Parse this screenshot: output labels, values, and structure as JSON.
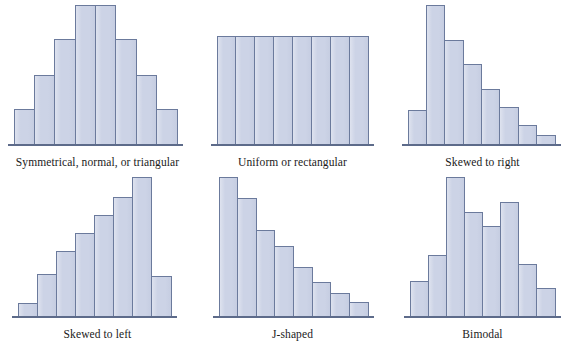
{
  "figure": {
    "title": "",
    "panel_count": 6,
    "bar_fill_color": "#ccd3e6",
    "bar_border_color": "#6b7a9c",
    "axis_color": "#5d6b8a",
    "background_color": "#ffffff",
    "label_color": "#1a1a1a"
  },
  "chart_data": [
    {
      "type": "bar",
      "title": "Symmetrical, normal, or triangular",
      "xlabel": "",
      "ylabel": "",
      "grid": false,
      "legend": false,
      "axis_range": [
        0,
        100
      ],
      "categories": [
        "1",
        "2",
        "3",
        "4",
        "5",
        "6",
        "7",
        "8"
      ],
      "values": [
        26,
        50,
        76,
        100,
        100,
        76,
        50,
        26
      ]
    },
    {
      "type": "bar",
      "title": "Uniform or rectangular",
      "xlabel": "",
      "ylabel": "",
      "grid": false,
      "legend": false,
      "axis_range": [
        0,
        100
      ],
      "categories": [
        "1",
        "2",
        "3",
        "4",
        "5",
        "6",
        "7",
        "8"
      ],
      "values": [
        78,
        78,
        78,
        78,
        78,
        78,
        78,
        78
      ]
    },
    {
      "type": "bar",
      "title": "Skewed to right",
      "xlabel": "",
      "ylabel": "",
      "grid": false,
      "legend": false,
      "axis_range": [
        0,
        100
      ],
      "categories": [
        "1",
        "2",
        "3",
        "4",
        "5",
        "6",
        "7"
      ],
      "values": [
        25,
        100,
        75,
        58,
        40,
        27,
        14,
        7
      ]
    },
    {
      "type": "bar",
      "title": "Skewed to left",
      "xlabel": "",
      "ylabel": "",
      "grid": false,
      "legend": false,
      "axis_range": [
        0,
        100
      ],
      "categories": [
        "1",
        "2",
        "3",
        "4",
        "5",
        "6",
        "7",
        "8"
      ],
      "values": [
        10,
        31,
        47,
        60,
        73,
        86,
        100,
        29
      ]
    },
    {
      "type": "bar",
      "title": "J-shaped",
      "xlabel": "",
      "ylabel": "",
      "grid": false,
      "legend": false,
      "axis_range": [
        0,
        100
      ],
      "categories": [
        "1",
        "2",
        "3",
        "4",
        "5",
        "6",
        "7"
      ],
      "values": [
        100,
        85,
        62,
        51,
        36,
        25,
        17,
        11
      ]
    },
    {
      "type": "bar",
      "title": "Bimodal",
      "xlabel": "",
      "ylabel": "",
      "grid": false,
      "legend": false,
      "axis_range": [
        0,
        100
      ],
      "categories": [
        "1",
        "2",
        "3",
        "4",
        "5",
        "6",
        "7",
        "8"
      ],
      "values": [
        26,
        44,
        100,
        75,
        65,
        82,
        38,
        21
      ]
    }
  ]
}
